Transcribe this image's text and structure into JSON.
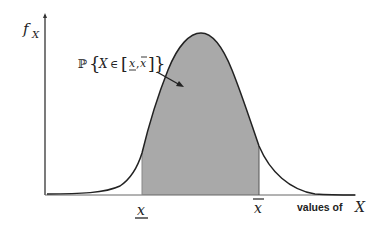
{
  "diagram": {
    "type": "probability-density-plot",
    "y_axis_label": {
      "main": "f",
      "subscript": "X"
    },
    "x_axis_label": {
      "prefix": "values of",
      "variable": "X"
    },
    "annotation": {
      "prob_symbol": "ℙ",
      "open_brace": "{",
      "variable": "X",
      "in_symbol": "∈",
      "open_bracket": "[",
      "lower": "x",
      "comma": ",",
      "upper": "x",
      "close_bracket": "]",
      "close_brace": "}"
    },
    "lower_bound_label": "x",
    "upper_bound_label": "x",
    "colors": {
      "curve": "#222222",
      "axes": "#333333",
      "shaded_area": "#a9a9a9",
      "background": "#ffffff"
    }
  }
}
